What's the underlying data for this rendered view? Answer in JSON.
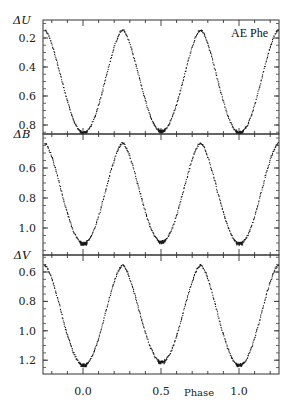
{
  "chart_data": {
    "type": "scatter",
    "title": "",
    "annotation": "AE Phe",
    "xlabel": "Phase",
    "xlim": [
      -0.25,
      1.25
    ],
    "xticks": [
      0.0,
      0.5,
      1.0
    ],
    "xtick_labels": [
      "0.0",
      "0.5",
      "1.0"
    ],
    "y_inverted": true,
    "grid": false,
    "legend": null,
    "panels": [
      {
        "name": "U",
        "ylabel": "ΔU",
        "ylim": [
          0.12,
          0.9
        ],
        "yticks": [
          0.2,
          0.4,
          0.6,
          0.8
        ],
        "ytick_labels": [
          "0.2",
          "0.4",
          "0.6",
          "0.8"
        ],
        "max_mag": 0.14,
        "primary_min": 0.85,
        "secondary_min": 0.84,
        "x": [
          -0.25,
          -0.15,
          -0.1,
          -0.05,
          0.0,
          0.05,
          0.1,
          0.15,
          0.25,
          0.35,
          0.4,
          0.45,
          0.5,
          0.55,
          0.6,
          0.65,
          0.75,
          0.85,
          0.9,
          0.95,
          1.0,
          1.05,
          1.1,
          1.15,
          1.25
        ],
        "y": [
          0.14,
          0.3,
          0.45,
          0.75,
          0.85,
          0.75,
          0.45,
          0.3,
          0.14,
          0.29,
          0.44,
          0.72,
          0.84,
          0.72,
          0.44,
          0.29,
          0.14,
          0.3,
          0.45,
          0.75,
          0.85,
          0.75,
          0.45,
          0.3,
          0.14
        ]
      },
      {
        "name": "B",
        "ylabel": "ΔB",
        "ylim": [
          0.38,
          1.18
        ],
        "yticks": [
          0.6,
          0.8,
          1.0
        ],
        "ytick_labels": [
          "0.6",
          "0.8",
          "1.0"
        ],
        "max_mag": 0.43,
        "primary_min": 1.1,
        "secondary_min": 1.09,
        "x": [
          -0.25,
          -0.15,
          -0.1,
          -0.05,
          0.0,
          0.05,
          0.1,
          0.15,
          0.25,
          0.35,
          0.4,
          0.45,
          0.5,
          0.55,
          0.6,
          0.65,
          0.75,
          0.85,
          0.9,
          0.95,
          1.0,
          1.05,
          1.1,
          1.15,
          1.25
        ],
        "y": [
          0.43,
          0.58,
          0.72,
          1.0,
          1.1,
          1.0,
          0.72,
          0.58,
          0.43,
          0.57,
          0.71,
          0.97,
          1.09,
          0.97,
          0.71,
          0.57,
          0.43,
          0.58,
          0.72,
          1.0,
          1.1,
          1.0,
          0.72,
          0.58,
          0.43
        ]
      },
      {
        "name": "V",
        "ylabel": "ΔV",
        "ylim": [
          0.5,
          1.3
        ],
        "yticks": [
          0.6,
          0.8,
          1.0,
          1.2
        ],
        "ytick_labels": [
          "0.6",
          "0.8",
          "1.0",
          "1.2"
        ],
        "max_mag": 0.55,
        "primary_min": 1.23,
        "secondary_min": 1.21,
        "x": [
          -0.25,
          -0.15,
          -0.1,
          -0.05,
          0.0,
          0.05,
          0.1,
          0.15,
          0.25,
          0.35,
          0.4,
          0.45,
          0.5,
          0.55,
          0.6,
          0.65,
          0.75,
          0.85,
          0.9,
          0.95,
          1.0,
          1.05,
          1.1,
          1.15,
          1.25
        ],
        "y": [
          0.55,
          0.7,
          0.85,
          1.13,
          1.23,
          1.13,
          0.85,
          0.7,
          0.55,
          0.69,
          0.84,
          1.1,
          1.21,
          1.1,
          0.84,
          0.69,
          0.55,
          0.7,
          0.85,
          1.13,
          1.23,
          1.13,
          0.85,
          0.7,
          0.55
        ]
      }
    ]
  }
}
